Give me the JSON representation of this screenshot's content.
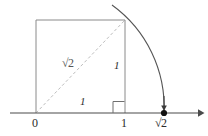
{
  "figure": {
    "type": "geometric-construction",
    "colors": {
      "axis": "#4a4a4a",
      "square": "#8a8a8a",
      "diagonal": "#b9b9b9",
      "arc": "#555555",
      "text": "#2b2b2b",
      "background": "#ffffff"
    }
  },
  "axis": {
    "name": "number-line",
    "y": 113,
    "x_start": 10,
    "x_end": 202,
    "arrow_end": "right"
  },
  "points": {
    "origin": {
      "label": "0",
      "x": 36,
      "y": 113
    },
    "unit": {
      "label": "1",
      "x": 125,
      "y": 113
    },
    "sqrt2": {
      "label": "√2",
      "x": 164,
      "y": 113,
      "has_dot": true,
      "has_down_arrow": true
    }
  },
  "square": {
    "name": "unit-square",
    "left": 36,
    "top": 20,
    "right": 125,
    "bottom": 113,
    "side_length_label": "1"
  },
  "labels": {
    "diagonal": "√2",
    "vertical_side": "1",
    "horizontal_side": "1",
    "origin": "0",
    "unit": "1",
    "sqrt2_tick": "√2"
  },
  "arc": {
    "name": "compass-arc",
    "center_x": 36,
    "center_y": 113,
    "radius": 126,
    "from": {
      "x": 112,
      "y": 5
    },
    "through": {
      "x": 125,
      "y": 20
    },
    "to": {
      "x": 164,
      "y": 113
    }
  },
  "right_angle_mark": {
    "name": "right-angle-mark",
    "x": 113,
    "y": 101,
    "size": 11
  }
}
